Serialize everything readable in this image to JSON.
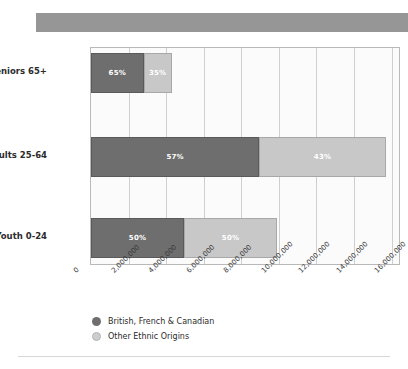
{
  "header": {
    "banner_color": "#969696"
  },
  "chart_data": {
    "type": "bar",
    "orientation": "horizontal",
    "stacked": true,
    "title": "",
    "xlabel": "",
    "ylabel": "",
    "categories": [
      "Seniors 65+",
      "Adults 25-64",
      "Youth 0-24"
    ],
    "series": [
      {
        "name": "British, French & Canadian",
        "color": "#6e6e6e",
        "values": [
          2795000,
          8949000,
          4950000
        ],
        "percent_labels": [
          "65%",
          "57%",
          "50%"
        ]
      },
      {
        "name": "Other Ethnic Origins",
        "color": "#c8c8c8",
        "values": [
          1505000,
          6751000,
          4950000
        ],
        "percent_labels": [
          "35%",
          "43%",
          "50%"
        ]
      }
    ],
    "totals": [
      4300000,
      15700000,
      9900000
    ],
    "xlim": [
      0,
      16500000
    ],
    "xticks": [
      0,
      2000000,
      4000000,
      6000000,
      8000000,
      10000000,
      12000000,
      14000000,
      16000000
    ],
    "xtick_labels": [
      "0",
      "2,000,000",
      "4,000,000",
      "6,000,000",
      "8,000,000",
      "10,000,000",
      "12,000,000",
      "14,000,000",
      "16,000,000"
    ],
    "grid": true,
    "legend_position": "bottom"
  }
}
